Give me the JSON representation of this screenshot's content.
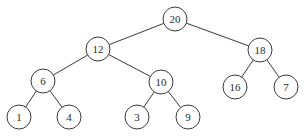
{
  "diagram": {
    "type": "binary-tree",
    "radius": 12,
    "nodes": [
      {
        "id": "n20",
        "label": "20",
        "x": 175,
        "y": 19
      },
      {
        "id": "n12",
        "label": "12",
        "x": 98,
        "y": 49
      },
      {
        "id": "n18",
        "label": "18",
        "x": 260,
        "y": 50
      },
      {
        "id": "n6",
        "label": "6",
        "x": 43,
        "y": 81
      },
      {
        "id": "n10",
        "label": "10",
        "x": 161,
        "y": 82
      },
      {
        "id": "n16",
        "label": "16",
        "x": 235,
        "y": 87
      },
      {
        "id": "n7",
        "label": "7",
        "x": 286,
        "y": 87
      },
      {
        "id": "n1",
        "label": "1",
        "x": 19,
        "y": 117
      },
      {
        "id": "n4",
        "label": "4",
        "x": 69,
        "y": 117
      },
      {
        "id": "n3",
        "label": "3",
        "x": 137,
        "y": 117
      },
      {
        "id": "n9",
        "label": "9",
        "x": 188,
        "y": 117
      }
    ],
    "edges": [
      {
        "from": "n20",
        "to": "n12"
      },
      {
        "from": "n20",
        "to": "n18"
      },
      {
        "from": "n12",
        "to": "n6"
      },
      {
        "from": "n12",
        "to": "n10"
      },
      {
        "from": "n18",
        "to": "n16"
      },
      {
        "from": "n18",
        "to": "n7"
      },
      {
        "from": "n6",
        "to": "n1"
      },
      {
        "from": "n6",
        "to": "n4"
      },
      {
        "from": "n10",
        "to": "n3"
      },
      {
        "from": "n10",
        "to": "n9"
      }
    ]
  }
}
